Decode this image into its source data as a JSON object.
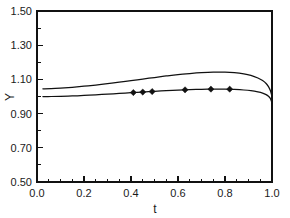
{
  "chart_data": {
    "type": "line",
    "title": "",
    "subtitle": "",
    "xlabel": "t",
    "ylabel": "Y",
    "xlim": [
      0.0,
      1.0
    ],
    "ylim": [
      0.5,
      1.5
    ],
    "grid": false,
    "legend": null,
    "x_ticks": [
      0.0,
      0.2,
      0.4,
      0.6,
      0.8,
      1.0
    ],
    "x_tick_labels": [
      "0.0",
      "0.2",
      "0.4",
      "0.6",
      "0.8",
      "1.0"
    ],
    "x_minor_ticks": [
      0.05,
      0.1,
      0.15,
      0.25,
      0.3,
      0.35,
      0.45,
      0.5,
      0.55,
      0.65,
      0.7,
      0.75,
      0.85,
      0.9,
      0.95
    ],
    "y_ticks": [
      0.5,
      0.7,
      0.9,
      1.1,
      1.3,
      1.5
    ],
    "y_tick_labels": [
      "0.50",
      "0.70",
      "0.90",
      "1.10",
      "1.30",
      "1.50"
    ],
    "y_minor_ticks": [
      0.6,
      0.8,
      1.0,
      1.2,
      1.4
    ],
    "series": [
      {
        "name": "upper-curve",
        "style": "line",
        "x": [
          0.025,
          0.06,
          0.1,
          0.15,
          0.2,
          0.25,
          0.3,
          0.35,
          0.4,
          0.45,
          0.5,
          0.55,
          0.6,
          0.65,
          0.7,
          0.75,
          0.8,
          0.84,
          0.88,
          0.91,
          0.94,
          0.96,
          0.975,
          0.985,
          0.993,
          1.0
        ],
        "y": [
          1.045,
          1.046,
          1.049,
          1.054,
          1.06,
          1.067,
          1.075,
          1.084,
          1.093,
          1.102,
          1.111,
          1.12,
          1.128,
          1.134,
          1.139,
          1.142,
          1.142,
          1.139,
          1.132,
          1.123,
          1.108,
          1.093,
          1.076,
          1.058,
          1.035,
          1.0
        ]
      },
      {
        "name": "lower-curve",
        "style": "line",
        "x": [
          0.025,
          0.06,
          0.1,
          0.15,
          0.2,
          0.25,
          0.3,
          0.35,
          0.4,
          0.45,
          0.5,
          0.55,
          0.6,
          0.65,
          0.7,
          0.75,
          0.8,
          0.84,
          0.88,
          0.91,
          0.94,
          0.96,
          0.975,
          0.985,
          0.993,
          1.0
        ],
        "y": [
          1.0,
          1.0,
          1.001,
          1.003,
          1.006,
          1.01,
          1.014,
          1.018,
          1.022,
          1.026,
          1.03,
          1.034,
          1.037,
          1.04,
          1.042,
          1.043,
          1.043,
          1.041,
          1.038,
          1.034,
          1.027,
          1.02,
          1.011,
          1.001,
          0.988,
          0.962
        ]
      },
      {
        "name": "data-points",
        "style": "marker",
        "marker": "diamond",
        "x": [
          0.41,
          0.45,
          0.49,
          0.63,
          0.74,
          0.82
        ],
        "y": [
          1.023,
          1.026,
          1.029,
          1.039,
          1.043,
          1.043
        ]
      }
    ],
    "colors": {
      "curve": "#111111",
      "marker": "#111111",
      "axis": "#111111",
      "background": "#ffffff"
    }
  }
}
